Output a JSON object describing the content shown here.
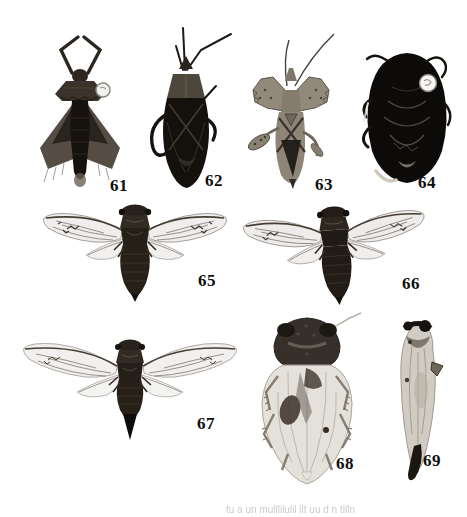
{
  "plate": {
    "background": "#ffffff",
    "label_color": "#0e0e0e"
  },
  "figures": [
    {
      "label": "61",
      "description": "dark bug with flared pronotum, spread triangular wings, white pin head"
    },
    {
      "label": "62",
      "description": "slender dark seed bug with long antennae"
    },
    {
      "label": "63",
      "description": "pale bug with serrated pronotal lobes and dark X wing pattern"
    },
    {
      "label": "64",
      "description": "broad oval black bug with round white pin label"
    },
    {
      "label": "65",
      "description": "cicada with spread transparent wings, dorsal view"
    },
    {
      "label": "66",
      "description": "cicada with spread transparent wings, slightly tilted"
    },
    {
      "label": "67",
      "description": "cicada with spread wings and pointed abdomen"
    },
    {
      "label": "68",
      "description": "broad pale leafhopper with dark head, dorsal view"
    },
    {
      "label": "69",
      "description": "slender pale leafhopper with dark head cap and curved tail"
    }
  ],
  "caption": {
    "fragment_glyphs": "tu a un mulllilulil ilt  uu  d  n  tilln",
    "legible": false,
    "color": "#c6c6c6"
  },
  "colors": {
    "specimen_dark": "#17130f",
    "specimen_pale": "#cfc9c0",
    "wing_membrane": "#8d877d",
    "wing_vein": "#6e675c",
    "pin_dot": "#f7f6f3"
  }
}
